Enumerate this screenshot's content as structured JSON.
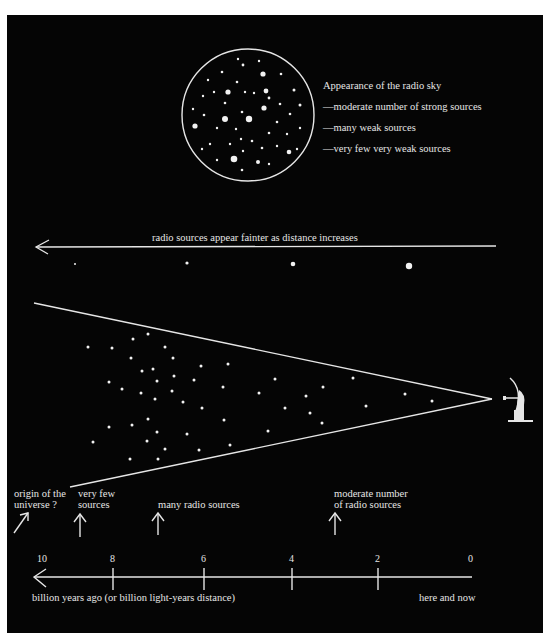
{
  "colors": {
    "background": "#050505",
    "foreground": "#e6e6e6",
    "page": "#ffffff"
  },
  "sky": {
    "title": "Appearance of the radio sky",
    "items": [
      "—moderate number of strong sources",
      "—many weak sources",
      "—very few very weak sources"
    ]
  },
  "faint_arrow": {
    "label": "radio sources appear fainter as distance increases"
  },
  "cone": {
    "observer_icon": "radio-telescope-icon"
  },
  "annotations": {
    "origin": [
      "origin of the",
      "universe ?"
    ],
    "very_few": [
      "very few",
      "sources"
    ],
    "many": "many radio sources",
    "moderate": [
      "moderate number",
      "of radio sources"
    ]
  },
  "timeline": {
    "ticks": [
      "10",
      "8",
      "6",
      "4",
      "2",
      "0"
    ],
    "axis_label": "billion years ago (or billion light-years distance)",
    "end_label": "here and now"
  }
}
